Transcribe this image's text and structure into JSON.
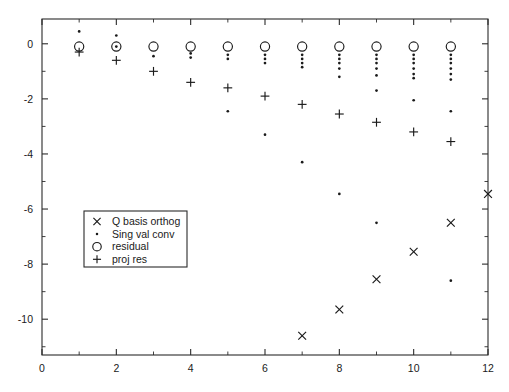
{
  "chart_data": {
    "type": "scatter",
    "title": "",
    "xlabel": "",
    "ylabel": "",
    "xlim": [
      0,
      12
    ],
    "ylim": [
      -11.3,
      0.9
    ],
    "xticks": [
      0,
      2,
      4,
      6,
      8,
      10,
      12
    ],
    "xticklabels": [
      "0",
      "2",
      "4",
      "6",
      "8",
      "10",
      "12"
    ],
    "xticks_minor": [
      1,
      3,
      5,
      7,
      9,
      11
    ],
    "yticks": [
      0,
      -2,
      -4,
      -6,
      -8,
      -10
    ],
    "yticklabels": [
      "0",
      "-2",
      "-4",
      "-6",
      "-8",
      "-10"
    ],
    "yticks_minor": [
      -1,
      -3,
      -5,
      -7,
      -9,
      -11
    ],
    "grid": false,
    "legend_position": "center-left",
    "series": [
      {
        "name": "Q basis orthog",
        "marker": "x",
        "points": [
          [
            7,
            -10.6
          ],
          [
            8,
            -9.65
          ],
          [
            9,
            -8.55
          ],
          [
            10,
            -7.55
          ],
          [
            11,
            -6.5
          ],
          [
            12,
            -5.45
          ]
        ]
      },
      {
        "name": "Sing val conv",
        "marker": "dot",
        "points": [
          [
            1,
            0.45
          ],
          [
            2,
            0.3
          ],
          [
            2,
            -0.1
          ],
          [
            3,
            -0.45
          ],
          [
            4,
            -0.35
          ],
          [
            4,
            -0.5
          ],
          [
            5,
            -0.4
          ],
          [
            5,
            -0.55
          ],
          [
            5,
            -2.45
          ],
          [
            6,
            -0.4
          ],
          [
            6,
            -0.55
          ],
          [
            6,
            -0.7
          ],
          [
            6,
            -3.3
          ],
          [
            7,
            -0.4
          ],
          [
            7,
            -0.55
          ],
          [
            7,
            -0.7
          ],
          [
            7,
            -0.85
          ],
          [
            7,
            -4.3
          ],
          [
            8,
            -0.4
          ],
          [
            8,
            -0.55
          ],
          [
            8,
            -0.7
          ],
          [
            8,
            -0.9
          ],
          [
            8,
            -1.2
          ],
          [
            8,
            -5.45
          ],
          [
            9,
            -0.4
          ],
          [
            9,
            -0.55
          ],
          [
            9,
            -0.7
          ],
          [
            9,
            -0.9
          ],
          [
            9,
            -1.15
          ],
          [
            9,
            -1.7
          ],
          [
            9,
            -6.5
          ],
          [
            10,
            -0.4
          ],
          [
            10,
            -0.55
          ],
          [
            10,
            -0.7
          ],
          [
            10,
            -0.9
          ],
          [
            10,
            -1.1
          ],
          [
            10,
            -1.25
          ],
          [
            10,
            -2.05
          ],
          [
            11,
            -0.4
          ],
          [
            11,
            -0.55
          ],
          [
            11,
            -0.7
          ],
          [
            11,
            -0.9
          ],
          [
            11,
            -1.1
          ],
          [
            11,
            -1.3
          ],
          [
            11,
            -2.45
          ],
          [
            11,
            -8.6
          ]
        ]
      },
      {
        "name": "residual",
        "marker": "circle",
        "points": [
          [
            1,
            -0.1
          ],
          [
            2,
            -0.1
          ],
          [
            3,
            -0.1
          ],
          [
            4,
            -0.1
          ],
          [
            5,
            -0.1
          ],
          [
            6,
            -0.1
          ],
          [
            7,
            -0.1
          ],
          [
            8,
            -0.1
          ],
          [
            9,
            -0.1
          ],
          [
            10,
            -0.1
          ],
          [
            11,
            -0.1
          ]
        ]
      },
      {
        "name": "proj res",
        "marker": "plus",
        "points": [
          [
            1,
            -0.3
          ],
          [
            2,
            -0.6
          ],
          [
            3,
            -1.0
          ],
          [
            4,
            -1.4
          ],
          [
            5,
            -1.6
          ],
          [
            6,
            -1.9
          ],
          [
            7,
            -2.2
          ],
          [
            8,
            -2.55
          ],
          [
            9,
            -2.85
          ],
          [
            10,
            -3.2
          ],
          [
            11,
            -3.55
          ]
        ]
      }
    ],
    "legend": [
      {
        "marker": "x",
        "label": "Q basis orthog"
      },
      {
        "marker": "dot",
        "label": "Sing val conv"
      },
      {
        "marker": "circle",
        "label": "residual"
      },
      {
        "marker": "plus",
        "label": "proj res"
      }
    ]
  },
  "colors": {
    "foreground": "#1a1a1a",
    "axis": "#2b2b2b",
    "background": "#ffffff"
  }
}
